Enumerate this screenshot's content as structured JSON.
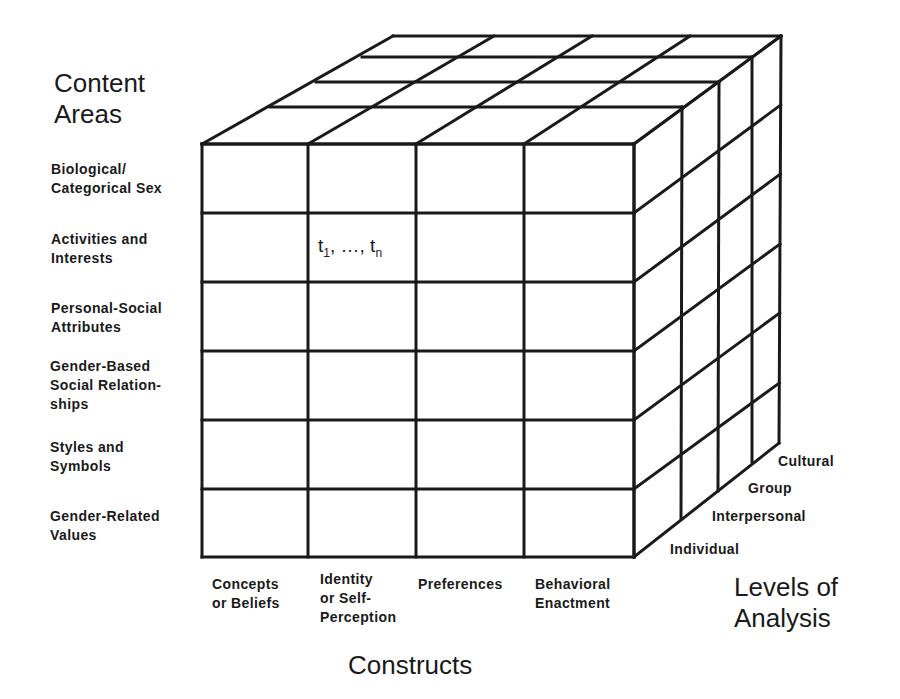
{
  "axes": {
    "content_title": "Content\nAreas",
    "constructs_title": "Constructs",
    "levels_title": "Levels of\nAnalysis"
  },
  "content_areas": [
    "Biological/\nCategorical Sex",
    "Activities and\nInterests",
    "Personal-Social\nAttributes",
    "Gender-Based\nSocial Relation-\nships",
    "Styles and\nSymbols",
    "Gender-Related\nValues"
  ],
  "constructs": [
    "Concepts\nor Beliefs",
    "Identity\nor Self-\nPerception",
    "Preferences",
    "Behavioral\nEnactment"
  ],
  "levels": [
    "Individual",
    "Interpersonal",
    "Group",
    "Cultural"
  ],
  "cell_annotation": {
    "t": "t",
    "sub1": "1",
    "ellipsis": ", …, ",
    "subn": "n"
  },
  "geometry": {
    "front_x": [
      202,
      308,
      416,
      524,
      634
    ],
    "front_y": [
      144,
      213,
      282,
      351,
      420,
      489,
      557
    ],
    "top_left_depth": [
      [
        202,
        144
      ],
      [
        270,
        107
      ],
      [
        316,
        82
      ],
      [
        362,
        57
      ],
      [
        393,
        36
      ]
    ],
    "top_right_depth": [
      [
        634,
        144
      ],
      [
        682,
        107
      ],
      [
        719,
        82
      ],
      [
        752,
        57
      ],
      [
        781,
        36
      ]
    ],
    "back_x": [
      393,
      494,
      592,
      690,
      781
    ],
    "back_right_y": [
      36,
      105,
      174,
      244,
      313,
      383,
      443
    ],
    "bottom_right_depth": [
      [
        634,
        557
      ],
      [
        681,
        519
      ],
      [
        718,
        491
      ],
      [
        752,
        462
      ],
      [
        779,
        443
      ]
    ],
    "stroke": "#1a1a1a",
    "stroke_width": 3
  }
}
